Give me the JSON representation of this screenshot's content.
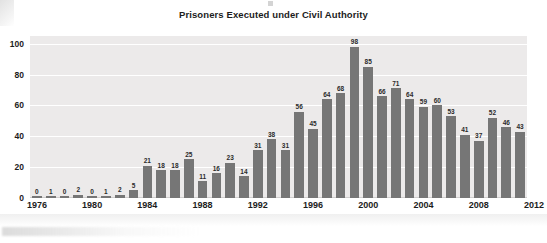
{
  "chart_data": {
    "type": "bar",
    "title": "Prisoners Executed under Civil Authority",
    "xlabel": "",
    "ylabel": "",
    "ylim": [
      0,
      105
    ],
    "yticks": [
      0,
      20,
      40,
      60,
      80,
      100
    ],
    "xticks": [
      "1976",
      "1980",
      "1984",
      "1988",
      "1992",
      "1996",
      "2000",
      "2004",
      "2008",
      "2012"
    ],
    "grid": "horizontal",
    "legend": "none",
    "bar_color": "#767676",
    "plot_background": "#eceaea",
    "categories": [
      "1976",
      "1977",
      "1978",
      "1979",
      "1980",
      "1981",
      "1982",
      "1983",
      "1984",
      "1985",
      "1986",
      "1987",
      "1988",
      "1989",
      "1990",
      "1991",
      "1992",
      "1993",
      "1994",
      "1995",
      "1996",
      "1997",
      "1998",
      "1999",
      "2000",
      "2001",
      "2002",
      "2003",
      "2004",
      "2005",
      "2006",
      "2007",
      "2008",
      "2009",
      "2010",
      "2011"
    ],
    "values": [
      0,
      1,
      0,
      2,
      0,
      1,
      2,
      5,
      21,
      18,
      18,
      25,
      11,
      16,
      23,
      14,
      31,
      38,
      31,
      56,
      45,
      64,
      68,
      98,
      85,
      66,
      71,
      64,
      59,
      60,
      53,
      41,
      37,
      52,
      46,
      43
    ]
  }
}
